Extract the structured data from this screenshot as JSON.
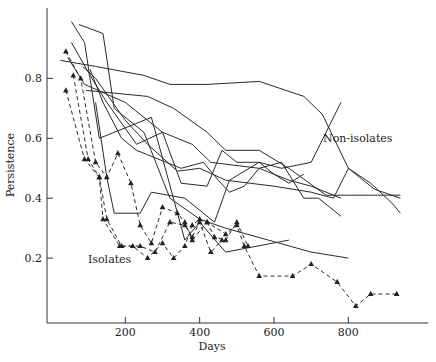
{
  "chart_data": {
    "type": "line",
    "title": "",
    "xlabel": "Days",
    "ylabel": "Persistence",
    "xlim": [
      0,
      1000
    ],
    "ylim": [
      0,
      0.97
    ],
    "xticks": [
      200,
      400,
      600,
      800
    ],
    "yticks": [
      0.2,
      0.4,
      0.6,
      0.8
    ],
    "xtick_labels": [
      "200",
      "400",
      "600",
      "800"
    ],
    "ytick_labels": [
      "0.2",
      "0.4",
      "0.6",
      "0.8"
    ],
    "grid": false,
    "legend": null,
    "annotations": [
      {
        "text": "Non-isolates",
        "x": 735,
        "y": 0.6
      },
      {
        "text": "Isolates",
        "x": 120,
        "y": 0.2
      }
    ],
    "series": [
      {
        "name": "Non-isolates 1",
        "style": "solid",
        "points": [
          [
            55,
            0.99
          ],
          [
            90,
            0.92
          ],
          [
            130,
            0.6
          ],
          [
            270,
            0.67
          ],
          [
            360,
            0.26
          ],
          [
            400,
            0.32
          ],
          [
            470,
            0.22
          ],
          [
            640,
            0.26
          ]
        ]
      },
      {
        "name": "Non-isolates 2",
        "style": "solid",
        "points": [
          [
            75,
            0.98
          ],
          [
            140,
            0.95
          ],
          [
            170,
            0.7
          ],
          [
            250,
            0.62
          ],
          [
            320,
            0.4
          ],
          [
            400,
            0.33
          ],
          [
            470,
            0.3
          ],
          [
            700,
            0.22
          ],
          [
            800,
            0.2
          ]
        ]
      },
      {
        "name": "Non-isolates 3",
        "style": "solid",
        "points": [
          [
            55,
            0.92
          ],
          [
            110,
            0.8
          ],
          [
            150,
            0.72
          ],
          [
            230,
            0.58
          ],
          [
            300,
            0.62
          ],
          [
            350,
            0.45
          ],
          [
            420,
            0.44
          ],
          [
            460,
            0.56
          ],
          [
            500,
            0.52
          ],
          [
            560,
            0.52
          ],
          [
            620,
            0.5
          ],
          [
            700,
            0.52
          ],
          [
            780,
            0.72
          ]
        ]
      },
      {
        "name": "Non-isolates 4",
        "style": "solid",
        "points": [
          [
            25,
            0.86
          ],
          [
            120,
            0.84
          ],
          [
            250,
            0.81
          ],
          [
            320,
            0.78
          ],
          [
            420,
            0.78
          ],
          [
            560,
            0.79
          ],
          [
            680,
            0.74
          ],
          [
            730,
            0.68
          ],
          [
            800,
            0.5
          ],
          [
            860,
            0.45
          ],
          [
            920,
            0.38
          ],
          [
            940,
            0.35
          ]
        ]
      },
      {
        "name": "Non-isolates 5",
        "style": "solid",
        "points": [
          [
            45,
            0.87
          ],
          [
            90,
            0.78
          ],
          [
            200,
            0.72
          ],
          [
            300,
            0.62
          ],
          [
            380,
            0.58
          ],
          [
            430,
            0.52
          ],
          [
            560,
            0.5
          ],
          [
            640,
            0.46
          ],
          [
            700,
            0.44
          ],
          [
            780,
            0.4
          ]
        ]
      },
      {
        "name": "Non-isolates 6",
        "style": "solid",
        "points": [
          [
            85,
            0.84
          ],
          [
            120,
            0.8
          ],
          [
            200,
            0.66
          ],
          [
            260,
            0.58
          ],
          [
            340,
            0.49
          ],
          [
            400,
            0.5
          ],
          [
            470,
            0.46
          ],
          [
            600,
            0.44
          ],
          [
            700,
            0.42
          ],
          [
            760,
            0.4
          ],
          [
            800,
            0.5
          ],
          [
            870,
            0.43
          ],
          [
            940,
            0.4
          ]
        ]
      },
      {
        "name": "Non-isolates 7",
        "style": "solid",
        "points": [
          [
            95,
            0.76
          ],
          [
            260,
            0.74
          ],
          [
            330,
            0.7
          ],
          [
            420,
            0.62
          ],
          [
            470,
            0.56
          ],
          [
            560,
            0.56
          ],
          [
            640,
            0.5
          ],
          [
            740,
            0.41
          ],
          [
            800,
            0.41
          ],
          [
            860,
            0.41
          ],
          [
            940,
            0.41
          ]
        ]
      },
      {
        "name": "Non-isolates 8",
        "style": "solid",
        "points": [
          [
            120,
            0.72
          ],
          [
            150,
            0.47
          ],
          [
            170,
            0.35
          ],
          [
            240,
            0.35
          ],
          [
            270,
            0.42
          ],
          [
            360,
            0.4
          ],
          [
            420,
            0.34
          ],
          [
            440,
            0.32
          ],
          [
            480,
            0.46
          ],
          [
            560,
            0.52
          ],
          [
            600,
            0.48
          ],
          [
            640,
            0.45
          ],
          [
            680,
            0.48
          ]
        ]
      },
      {
        "name": "Non-isolates 9",
        "style": "solid",
        "points": [
          [
            105,
            0.83
          ],
          [
            140,
            0.72
          ],
          [
            190,
            0.6
          ],
          [
            230,
            0.56
          ],
          [
            310,
            0.52
          ],
          [
            350,
            0.5
          ],
          [
            410,
            0.52
          ],
          [
            450,
            0.46
          ],
          [
            480,
            0.42
          ],
          [
            520,
            0.44
          ],
          [
            560,
            0.5
          ],
          [
            620,
            0.52
          ],
          [
            680,
            0.4
          ],
          [
            720,
            0.4
          ],
          [
            780,
            0.34
          ]
        ]
      },
      {
        "name": "Isolates 1",
        "style": "dashed",
        "points": [
          [
            40,
            0.89
          ],
          [
            80,
            0.8
          ],
          [
            120,
            0.52
          ],
          [
            150,
            0.47
          ],
          [
            180,
            0.55
          ],
          [
            215,
            0.45
          ],
          [
            240,
            0.31
          ],
          [
            270,
            0.25
          ],
          [
            300,
            0.37
          ],
          [
            340,
            0.35
          ],
          [
            360,
            0.32
          ],
          [
            380,
            0.26
          ],
          [
            420,
            0.32
          ],
          [
            470,
            0.28
          ],
          [
            500,
            0.31
          ],
          [
            520,
            0.24
          ],
          [
            560,
            0.14
          ],
          [
            650,
            0.14
          ],
          [
            700,
            0.18
          ],
          [
            770,
            0.12
          ],
          [
            820,
            0.04
          ],
          [
            860,
            0.08
          ],
          [
            930,
            0.08
          ]
        ]
      },
      {
        "name": "Isolates 2",
        "style": "dashed",
        "points": [
          [
            60,
            0.81
          ],
          [
            100,
            0.53
          ],
          [
            130,
            0.47
          ],
          [
            140,
            0.33
          ],
          [
            185,
            0.24
          ],
          [
            220,
            0.24
          ],
          [
            260,
            0.2
          ],
          [
            300,
            0.25
          ],
          [
            330,
            0.2
          ],
          [
            360,
            0.24
          ],
          [
            380,
            0.31
          ],
          [
            400,
            0.33
          ],
          [
            420,
            0.32
          ],
          [
            440,
            0.27
          ],
          [
            470,
            0.26
          ],
          [
            500,
            0.32
          ],
          [
            530,
            0.24
          ]
        ]
      },
      {
        "name": "Isolates 3",
        "style": "dashed",
        "points": [
          [
            40,
            0.76
          ],
          [
            90,
            0.53
          ],
          [
            130,
            0.47
          ],
          [
            150,
            0.33
          ],
          [
            190,
            0.24
          ],
          [
            240,
            0.24
          ],
          [
            280,
            0.22
          ],
          [
            320,
            0.32
          ],
          [
            360,
            0.31
          ],
          [
            380,
            0.27
          ],
          [
            400,
            0.32
          ],
          [
            430,
            0.22
          ],
          [
            460,
            0.26
          ]
        ]
      }
    ]
  }
}
